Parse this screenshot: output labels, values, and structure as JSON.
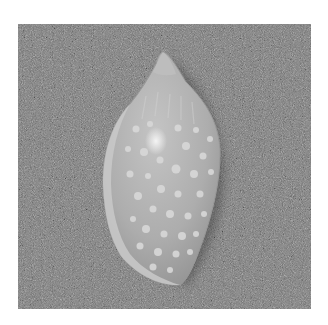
{
  "image": {
    "description": "Grayscale photograph of a glossy spotted cone-shaped sea shell lying on coarse gray sand-textured background",
    "subject": "spotted shell",
    "background": "textured gray sand",
    "colors": {
      "page_background": "#ffffff",
      "sand_base": "#7b7b7b",
      "shell_body": "#b4b4b4",
      "shell_highlight": "#e8e8e8",
      "spots": "#d6d6d6"
    }
  }
}
